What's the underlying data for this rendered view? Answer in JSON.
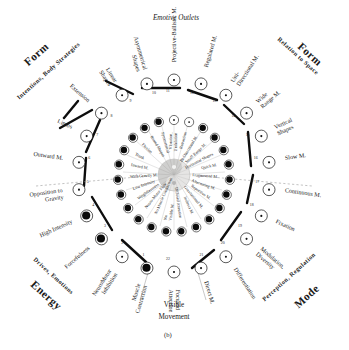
{
  "figure": {
    "caption": "(b)",
    "top_axis_label": "Emotive Outlets",
    "bottom_axis_label_line1": "Visible",
    "bottom_axis_label_line2": "Movement",
    "center_emblem": "yin-yang-emblem"
  },
  "quadrants": [
    {
      "id": "form-left",
      "big": "Form",
      "sub": "Intentions, Body Strategies"
    },
    {
      "id": "form-right",
      "big": "Form",
      "sub": "Relation to Space"
    },
    {
      "id": "energy",
      "big": "Energy",
      "sub": "Drives, Emotions"
    },
    {
      "id": "mode",
      "big": "Mode",
      "sub": "Perception, Regulation"
    }
  ],
  "outer_nodes": [
    {
      "n": "1",
      "label": "Muscle\nContraction",
      "filled": true
    },
    {
      "n": "2",
      "label": "NeuroMotor\nInhibition",
      "filled": false
    },
    {
      "n": "3",
      "label": "Forcefulness",
      "filled": true
    },
    {
      "n": "4",
      "label": "High Intensity",
      "filled": true
    },
    {
      "n": "5",
      "label": "Opposition to\nGravity",
      "filled": false
    },
    {
      "n": "6",
      "label": "Outward M.",
      "filled": false
    },
    {
      "n": "7",
      "label": "Limbs",
      "filled": false
    },
    {
      "n": "8",
      "label": "Extension",
      "filled": false
    },
    {
      "n": "9",
      "label": "Linear\nShapes",
      "filled": false
    },
    {
      "n": "10",
      "label": "Asymmetrical\nShapes",
      "filled": false
    },
    {
      "n": "11",
      "label": "Projective-Ballistic M.",
      "filled": false
    },
    {
      "n": "12",
      "label": "Regulated M.",
      "filled": false
    },
    {
      "n": "13",
      "label": "Uni-\nDirectional M.",
      "filled": false
    },
    {
      "n": "14",
      "label": "Wide\nRange M.",
      "filled": false
    },
    {
      "n": "15",
      "label": "Vertical\nShapes",
      "filled": false
    },
    {
      "n": "16",
      "label": "Slow M.",
      "filled": false
    },
    {
      "n": "17",
      "label": "Continuous M.",
      "filled": false
    },
    {
      "n": "18",
      "label": "Fixation",
      "filled": false
    },
    {
      "n": "19",
      "label": "Modulation,\nDiversity",
      "filled": false
    },
    {
      "n": "20",
      "label": "Differentiation",
      "filled": false
    },
    {
      "n": "21",
      "label": "Direct M.",
      "filled": false
    },
    {
      "n": "22",
      "label": "Focused\nAttention",
      "filled": false
    }
  ],
  "inner_nodes": [
    {
      "n": "a",
      "label": "Vibration,\nUndulation",
      "filled": false
    },
    {
      "n": "b",
      "label": "Retraction",
      "filled": false
    },
    {
      "n": "c",
      "label": "Bi-Directional M.",
      "filled": true
    },
    {
      "n": "d",
      "label": "Small Range M.",
      "filled": true
    },
    {
      "n": "e",
      "label": "Horizontal Shapes",
      "filled": true
    },
    {
      "n": "f",
      "label": "Quick M.",
      "filled": true
    },
    {
      "n": "g",
      "label": "Fragmented M.",
      "filled": true
    },
    {
      "n": "h",
      "label": "Alternating M.",
      "filled": true
    },
    {
      "n": "i",
      "label": "Repetitive M.",
      "filled": true
    },
    {
      "n": "j",
      "label": "Gravitational M.",
      "filled": true
    },
    {
      "n": "k",
      "label": "Indirect M.",
      "filled": true
    },
    {
      "n": "l",
      "label": "Diffused Attention",
      "filled": true
    },
    {
      "n": "m",
      "label": "No\nVisible M.",
      "filled": true
    },
    {
      "n": "n",
      "label": "No Muscle Contraction",
      "filled": true
    },
    {
      "n": "o",
      "label": "Neuro-Motor Flow",
      "filled": true
    },
    {
      "n": "p",
      "label": "Weightlessness",
      "filled": true
    },
    {
      "n": "q",
      "label": "Low Intensity",
      "filled": true
    },
    {
      "n": "r",
      "label": "With Gravity M.",
      "filled": true
    },
    {
      "n": "s",
      "label": "Inward M.",
      "filled": true
    },
    {
      "n": "t",
      "label": "Trunk",
      "filled": true
    },
    {
      "n": "u",
      "label": "Flexion",
      "filled": true
    },
    {
      "n": "v",
      "label": "Round Shapes",
      "filled": true
    },
    {
      "n": "w",
      "label": "Symmetrical",
      "filled": true
    }
  ]
}
